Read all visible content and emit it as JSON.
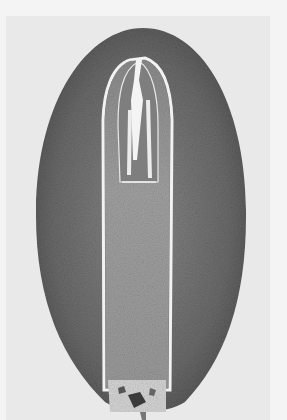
{
  "image": {
    "description": "Grayscale micrograph: longitudinal section of a seed/grain showing embryo inside speckled outer tissue",
    "colors": {
      "background": "#f4f4f4",
      "photo_background": "#e9e9e9",
      "outer_tissue_dark": "#5a5a5a",
      "outer_tissue_mid": "#7a7a7a",
      "inner_embryo": "#9a9a9a",
      "embryo_tip": "#8a8a8a",
      "boundary_line": "#f0f0f0",
      "base_tissue": "#d8d8d8"
    }
  }
}
